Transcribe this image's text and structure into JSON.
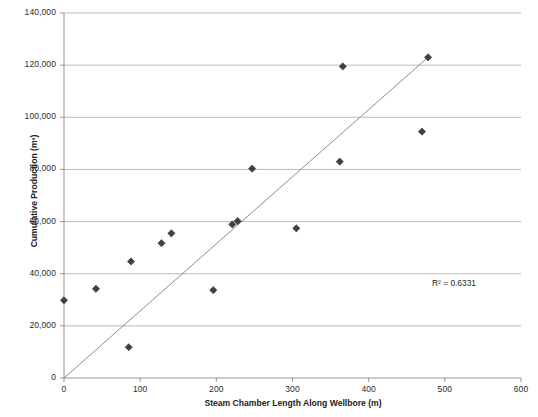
{
  "chart_data": {
    "type": "scatter",
    "title": "",
    "xlabel": "Steam Chamber Length Along Wellbore (m)",
    "ylabel": "Cumulative Production (m³)",
    "xlim": [
      0,
      600
    ],
    "ylim": [
      0,
      140000
    ],
    "xticks": [
      0,
      100,
      200,
      300,
      400,
      500,
      600
    ],
    "xtick_labels": [
      "0",
      "100",
      "200",
      "300",
      "400",
      "500",
      "600"
    ],
    "yticks": [
      0,
      20000,
      40000,
      60000,
      80000,
      100000,
      120000,
      140000
    ],
    "ytick_labels": [
      "0",
      "20,000",
      "40,000",
      "60,000",
      "80,000",
      "100,000",
      "120,000",
      "140,000"
    ],
    "grid": "horizontal",
    "legend": "none",
    "marker_shape": "diamond",
    "marker_color": "#404040",
    "line_color": "#808080",
    "points": [
      {
        "x": 0,
        "y": 29800
      },
      {
        "x": 42,
        "y": 34200
      },
      {
        "x": 85,
        "y": 11800
      },
      {
        "x": 88,
        "y": 44700
      },
      {
        "x": 128,
        "y": 51700
      },
      {
        "x": 141,
        "y": 55500
      },
      {
        "x": 196,
        "y": 33700
      },
      {
        "x": 221,
        "y": 58900
      },
      {
        "x": 228,
        "y": 60200
      },
      {
        "x": 247,
        "y": 80300
      },
      {
        "x": 305,
        "y": 57400
      },
      {
        "x": 362,
        "y": 83000
      },
      {
        "x": 366,
        "y": 119500
      },
      {
        "x": 470,
        "y": 94500
      },
      {
        "x": 478,
        "y": 123000
      }
    ],
    "trendline": {
      "x_start": 0,
      "y_start": 0,
      "x_end": 478,
      "y_end": 123000
    },
    "annotations": [
      {
        "name": "r-squared",
        "text": "R² = 0.6331",
        "value": 0.6331
      }
    ]
  }
}
